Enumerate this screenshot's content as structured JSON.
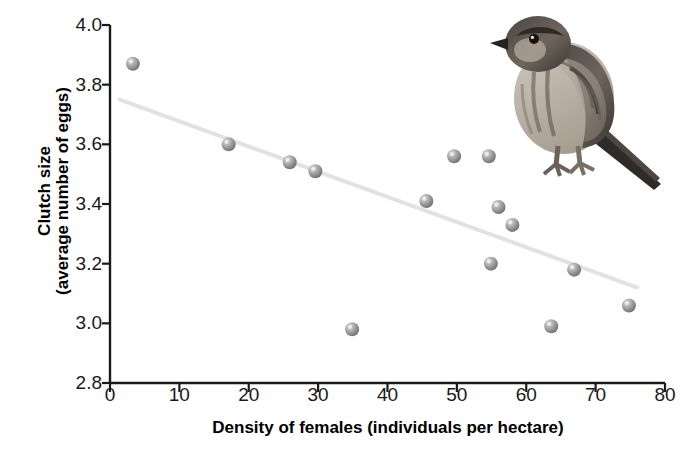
{
  "chart_data": {
    "type": "scatter",
    "title": "",
    "xlabel": "Density of females (individuals per hectare)",
    "ylabel": "Clutch size",
    "ylabel_line2": "(average number of eggs)",
    "xlim": [
      0,
      80
    ],
    "ylim": [
      2.8,
      4.0
    ],
    "xticks": [
      0,
      10,
      20,
      30,
      40,
      50,
      60,
      70,
      80
    ],
    "yticks": [
      "2.8",
      "3.0",
      "3.2",
      "3.4",
      "3.6",
      "3.8",
      "4.0"
    ],
    "xtick_labels": [
      "0",
      "10",
      "20",
      "30",
      "40",
      "50",
      "60",
      "70",
      "80"
    ],
    "grid": false,
    "legend": false,
    "points": [
      {
        "x": 3.3,
        "y": 3.87
      },
      {
        "x": 17.1,
        "y": 3.6
      },
      {
        "x": 25.9,
        "y": 3.54
      },
      {
        "x": 29.6,
        "y": 3.51
      },
      {
        "x": 34.9,
        "y": 2.98
      },
      {
        "x": 45.6,
        "y": 3.41
      },
      {
        "x": 49.6,
        "y": 3.56
      },
      {
        "x": 54.6,
        "y": 3.56
      },
      {
        "x": 54.9,
        "y": 3.2
      },
      {
        "x": 56.0,
        "y": 3.39
      },
      {
        "x": 58.0,
        "y": 3.33
      },
      {
        "x": 63.6,
        "y": 2.99
      },
      {
        "x": 66.9,
        "y": 3.18
      },
      {
        "x": 74.8,
        "y": 3.06
      }
    ],
    "trendline": {
      "type": "linear-fit",
      "x_start": 1.4,
      "y_start": 3.75,
      "x_end": 76.0,
      "y_end": 3.12,
      "color": "#e2e2e2"
    },
    "marker": {
      "shape": "sphere",
      "color": "#8c8c8c",
      "highlight_color": "#d8d8d8",
      "radius_px": 7
    },
    "axis_color": "#1a1a1a"
  },
  "illustration": {
    "name": "sparrow-bird",
    "alt": "Perched streaked brown sparrow illustration"
  }
}
